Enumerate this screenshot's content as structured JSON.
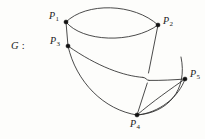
{
  "figure": {
    "name_label": "G",
    "name_separator": ":",
    "background_color": "#fdfdfb",
    "ink_color": "#2b2b2b",
    "width": 205,
    "height": 139
  },
  "graph_data": {
    "type": "diagram",
    "kind": "multigraph-drawing",
    "title": "G",
    "vertices": [
      {
        "id": "P1",
        "label_base": "P",
        "label_sub": "1",
        "x": 66,
        "y": 22,
        "label_x": 49,
        "label_y": 13,
        "label_anchor": "left"
      },
      {
        "id": "P2",
        "label_base": "P",
        "label_sub": "2",
        "x": 158,
        "y": 25,
        "label_x": 163,
        "label_y": 18,
        "label_anchor": "left"
      },
      {
        "id": "P3",
        "label_base": "P",
        "label_sub": "3",
        "x": 68,
        "y": 46,
        "label_x": 51,
        "label_y": 38,
        "label_anchor": "left"
      },
      {
        "id": "P4",
        "label_base": "P",
        "label_sub": "4",
        "x": 137,
        "y": 115,
        "label_x": 130,
        "label_y": 120,
        "label_anchor": "left"
      },
      {
        "id": "P5",
        "label_base": "P",
        "label_sub": "5",
        "x": 185,
        "y": 79,
        "label_x": 190,
        "label_y": 71,
        "label_anchor": "left"
      }
    ],
    "edges": [
      {
        "id": "e1",
        "from": "P1",
        "to": "P2",
        "style": "arc-upper",
        "path": "M66,22 C 86,2 134,3 158,25"
      },
      {
        "id": "e2",
        "from": "P1",
        "to": "P2",
        "style": "arc-lower",
        "path": "M66,22 C 82,42 132,44 158,25"
      },
      {
        "id": "e3",
        "from": "P1",
        "to": "P3",
        "style": "straight",
        "path": "M66,22 L 68,46"
      },
      {
        "id": "e4",
        "from": "P2",
        "to": "P4",
        "style": "straight-broken",
        "path": "M158,25 L 148,74"
      },
      {
        "id": "e5",
        "from": "P2",
        "to": "P4",
        "style": "straight-broken-cont",
        "path": "M147,82 L 137,115"
      },
      {
        "id": "e6",
        "from": "P3",
        "to": "P5",
        "style": "arc-bridge",
        "path": "M68,46 C 96,66 122,76 142,77"
      },
      {
        "id": "e7",
        "from": "P3",
        "to": "P5",
        "style": "arc-bridge-cont",
        "path": "M151,77 C 164,77 176,78 185,79"
      },
      {
        "id": "e8",
        "from": "P3",
        "to": "P4",
        "style": "arc-outer",
        "path": "M68,46 C 76,82 104,110 137,115"
      },
      {
        "id": "e9",
        "from": "P4",
        "to": "P5",
        "style": "arc-upper",
        "path": "M137,115 C 152,102 172,88 185,79"
      },
      {
        "id": "e10",
        "from": "P4",
        "to": "P5",
        "style": "arc-lower",
        "path": "M137,115 C 158,114 178,96 185,79"
      },
      {
        "id": "e11",
        "from": "P4",
        "to": "P2",
        "style": "arc-outer-right",
        "path": "M137,115 C 166,114 186,92 183,60"
      }
    ],
    "crossings": [
      {
        "id": "x1",
        "x": 147,
        "y": 78,
        "over": "e6",
        "under": "e4",
        "notation": "bridge-hop"
      }
    ]
  }
}
